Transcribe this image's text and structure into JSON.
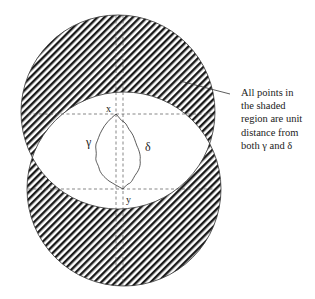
{
  "figure": {
    "type": "geometric-diagram",
    "point_labels": {
      "x": "x",
      "y": "y"
    },
    "curve_labels": {
      "gamma": "γ",
      "delta": "δ"
    },
    "annotation": {
      "lines": [
        "All points in",
        "the shaded",
        "region are unit",
        "distance from",
        "both γ and δ"
      ]
    },
    "colors": {
      "hatch": "#1a1a1a",
      "outline": "#333333",
      "dash": "#555555",
      "background": "#ffffff"
    },
    "geometry": {
      "upper_circle": {
        "cx": 118,
        "cy": 112,
        "r": 97
      },
      "lower_circle": {
        "cx": 124,
        "cy": 189,
        "r": 97
      },
      "point_x": {
        "x": 116,
        "y": 114
      },
      "point_y": {
        "x": 123,
        "y": 189
      }
    }
  }
}
